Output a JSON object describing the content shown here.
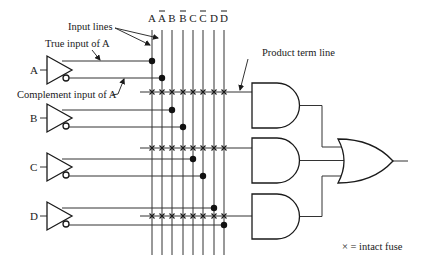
{
  "diagram": {
    "type": "programmable-logic-array",
    "columns": [
      {
        "label": "A",
        "bar": false,
        "x": 152
      },
      {
        "label": "A",
        "bar": true,
        "x": 162
      },
      {
        "label": "B",
        "bar": false,
        "x": 172
      },
      {
        "label": "B",
        "bar": true,
        "x": 183
      },
      {
        "label": "C",
        "bar": false,
        "x": 193
      },
      {
        "label": "C",
        "bar": true,
        "x": 203
      },
      {
        "label": "D",
        "bar": false,
        "x": 214
      },
      {
        "label": "D",
        "bar": true,
        "x": 224
      }
    ],
    "inputs": [
      {
        "label": "A",
        "y": 70,
        "true_y": 61,
        "comp_y": 78,
        "true_col": 0,
        "comp_col": 1
      },
      {
        "label": "B",
        "y": 118,
        "true_y": 110,
        "comp_y": 127,
        "true_col": 2,
        "comp_col": 3
      },
      {
        "label": "C",
        "y": 167,
        "true_y": 159,
        "comp_y": 176,
        "true_col": 4,
        "comp_col": 5
      },
      {
        "label": "D",
        "y": 216,
        "true_y": 208,
        "comp_y": 225,
        "true_col": 6,
        "comp_col": 7
      }
    ],
    "product_terms": [
      92,
      148,
      216
    ],
    "annotations": {
      "input_lines": "Input lines",
      "true_input": "True input of A",
      "complement_input": "Complement input of A",
      "product_term_line": "Product term line",
      "legend": "× = intact fuse"
    }
  }
}
